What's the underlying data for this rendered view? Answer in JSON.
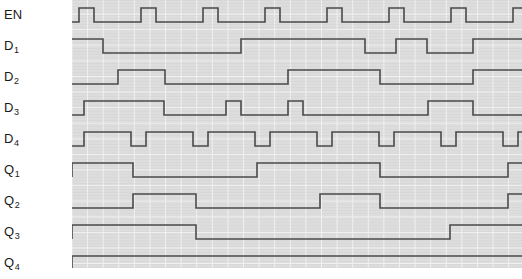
{
  "labels": {
    "enable": "EN",
    "d1_base": "D",
    "d1_sub": "1",
    "d2_base": "D",
    "d2_sub": "2",
    "d3_base": "D",
    "d3_sub": "3",
    "d4_base": "D",
    "d4_sub": "4",
    "q1_base": "Q",
    "q1_sub": "1",
    "q2_base": "Q",
    "q2_sub": "2",
    "q3_base": "Q",
    "q3_sub": "3",
    "q4_base": "Q",
    "q4_sub": "4"
  },
  "colors": {
    "trace": "#4a4a4a",
    "plot_background": "#dcdcdc",
    "grid_line": "#f4f4f4",
    "page_background": "#ffffff",
    "label_text": "#1a1a1a"
  },
  "chart_data": {
    "type": "line",
    "subtype": "digital-timing-waveform",
    "xlabel": "",
    "ylabel": "",
    "grid": true,
    "legend": "none",
    "x_units": "pixels",
    "x_range": [
      0,
      450
    ],
    "grid_spacing_px": 15.6,
    "trace_row_height_px": 31,
    "signal_high_offset_px": 8,
    "signal_low_offset_px": 22,
    "series": [
      {
        "name": "EN",
        "row": 0,
        "row_top_px": 0,
        "description": "periodic clock, high for about 1 grid, low for about 3 grids, period about 62 px",
        "initial_level": 0,
        "transitions_px": [
          7,
          22,
          69,
          84,
          131,
          146,
          193,
          208,
          255,
          270,
          317,
          332,
          379,
          394,
          441
        ],
        "levels": [
          0,
          1,
          0,
          1,
          0,
          1,
          0,
          1,
          0,
          1,
          0,
          1,
          0,
          1,
          0,
          1
        ]
      },
      {
        "name": "D1",
        "row": 1,
        "row_top_px": 31,
        "description": "starts high, falls, long low, rises, short pulses near the end",
        "initial_level": 1,
        "transitions_px": [
          31,
          169,
          293,
          324,
          355,
          401
        ],
        "levels": [
          1,
          0,
          1,
          0,
          1,
          0,
          1
        ]
      },
      {
        "name": "D2",
        "row": 2,
        "row_top_px": 62,
        "description": "low, one medium pulse, long low, one long pulse, low, high at end",
        "initial_level": 0,
        "transitions_px": [
          46,
          93,
          216,
          308,
          401
        ],
        "levels": [
          0,
          1,
          0,
          1,
          0,
          1
        ]
      },
      {
        "name": "D3",
        "row": 3,
        "row_top_px": 93,
        "description": "rises early, long high, two narrow pulses, one wide pulse, ends low",
        "initial_level": 0,
        "transitions_px": [
          12,
          92,
          154,
          169,
          216,
          231,
          356,
          401
        ],
        "levels": [
          0,
          1,
          0,
          1,
          0,
          1,
          0,
          1,
          0
        ]
      },
      {
        "name": "D4",
        "row": 4,
        "row_top_px": 124,
        "description": "fast oscillation, about 47 px period, high about 32 px and low about 15 px",
        "initial_level": 0,
        "transitions_px": [
          12,
          59,
          74,
          121,
          136,
          183,
          198,
          245,
          260,
          307,
          322,
          369,
          384,
          431,
          446
        ],
        "levels": [
          0,
          1,
          0,
          1,
          0,
          1,
          0,
          1,
          0,
          1,
          0,
          1,
          0,
          1,
          0,
          1
        ]
      },
      {
        "name": "Q1",
        "row": 5,
        "row_top_px": 155,
        "description": "registered output, toggles on roughly every other clock",
        "initial_level": 0,
        "transitions_px": [
          0,
          61,
          185,
          308,
          436
        ],
        "levels": [
          0,
          1,
          0,
          1,
          0,
          1
        ]
      },
      {
        "name": "Q2",
        "row": 6,
        "row_top_px": 186,
        "description": "registered output, low then pulse then low then long pulse then high at end",
        "initial_level": 0,
        "transitions_px": [
          0,
          61,
          124,
          248,
          308,
          436
        ],
        "levels": [
          0,
          0,
          1,
          0,
          1,
          0,
          1
        ]
      },
      {
        "name": "Q3",
        "row": 7,
        "row_top_px": 217,
        "description": "registered output, high for the first third, low, then rises near the end",
        "initial_level": 0,
        "transitions_px": [
          0,
          124,
          378
        ],
        "levels": [
          0,
          1,
          0,
          1
        ]
      },
      {
        "name": "Q4",
        "row": 8,
        "row_top_px": 248,
        "description": "registered output, rises at the start and stays high",
        "initial_level": 0,
        "transitions_px": [
          0
        ],
        "levels": [
          0,
          1
        ]
      }
    ]
  }
}
